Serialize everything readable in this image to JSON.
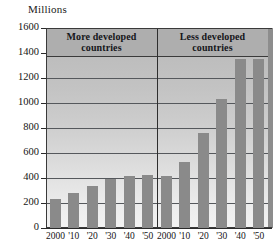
{
  "chart_data": {
    "type": "bar",
    "title": "",
    "unit_caption": "Millions",
    "ylabel": "Millions",
    "xlabel": "",
    "ylim": [
      0,
      1600
    ],
    "ytick_labels": [
      "0",
      "200",
      "400",
      "600",
      "800",
      "1000",
      "1200",
      "1400",
      "1600"
    ],
    "ytick_values": [
      0,
      200,
      400,
      600,
      800,
      1000,
      1200,
      1400,
      1600
    ],
    "grid": true,
    "legend_position": "none",
    "groups": [
      {
        "label_line1": "More developed",
        "label_line2": "countries",
        "categories": [
          "2000",
          "'10",
          "'20",
          "'30",
          "'40",
          "'50"
        ],
        "values": [
          230,
          280,
          340,
          395,
          415,
          425
        ]
      },
      {
        "label_line1": "Less developed",
        "label_line2": "countries",
        "categories": [
          "2000",
          "'10",
          "'20",
          "'30",
          "'40",
          "'50"
        ],
        "values": [
          415,
          530,
          760,
          1030,
          1350,
          1350
        ]
      }
    ],
    "colors": {
      "bar": "#8a8a8a",
      "plot_background_top": "#b9b9b9",
      "plot_background_bottom": "#f2f2f2",
      "band_background": "#aeaeae",
      "gridline": "#55585c",
      "axis": "#2a2a2a",
      "text": "#141414"
    }
  }
}
